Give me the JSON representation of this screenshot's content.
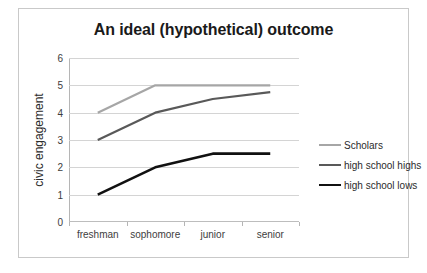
{
  "chart_data": {
    "type": "line",
    "title": "An ideal (hypothetical) outcome",
    "xlabel": "",
    "ylabel": "civic engagement",
    "categories": [
      "freshman",
      "sophomore",
      "junior",
      "senior"
    ],
    "ylim": [
      0,
      6
    ],
    "yticks": [
      "0",
      "1",
      "2",
      "3",
      "4",
      "5",
      "6"
    ],
    "grid": true,
    "legend_position": "right",
    "series": [
      {
        "name": "Scholars",
        "values": [
          4,
          5,
          5,
          5
        ],
        "color": "#a6a6a6",
        "width": 2.2
      },
      {
        "name": "high school highs",
        "values": [
          3,
          4,
          4.5,
          4.75
        ],
        "color": "#595959",
        "width": 2.2
      },
      {
        "name": "high school lows",
        "values": [
          1,
          2,
          2.5,
          2.5
        ],
        "color": "#111111",
        "width": 2.6
      }
    ]
  },
  "frame": {
    "border_color": "#c9c9c9",
    "background": "#ffffff"
  }
}
